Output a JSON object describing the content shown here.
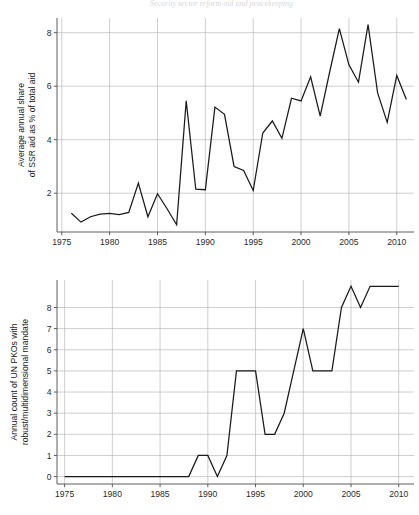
{
  "figure": {
    "header_fragment": "Security sector reform aid and peacekeeping",
    "background": "#ffffff",
    "line_color": "#1a1a1a",
    "grid_color": "#b9b9b9",
    "axis_color": "#4d4d4d"
  },
  "chart_data": [
    {
      "type": "line",
      "panel": "top",
      "title": "",
      "xlabel": "",
      "ylabel": "Average annual share\nof SSR aid as % of total aid",
      "ylabel_line1": "Average annual share",
      "ylabel_line2": "of SSR aid as % of total aid",
      "xlim": [
        1974.5,
        2011.8
      ],
      "ylim": [
        0.55,
        8.55
      ],
      "xticks": [
        1975,
        1980,
        1985,
        1990,
        1995,
        2000,
        2005,
        2010
      ],
      "xticklabels": [
        "1975",
        "1980",
        "1985",
        "1990",
        "1995",
        "2000",
        "2005",
        "2010"
      ],
      "yticks": [
        2,
        4,
        6,
        8
      ],
      "yticklabels": [
        "2",
        "4",
        "6",
        "8"
      ],
      "grid": true,
      "legend": false,
      "series": [
        {
          "name": "Average annual share of SSR aid as % of total aid",
          "x": [
            1976,
            1977,
            1978,
            1979,
            1980,
            1981,
            1982,
            1983,
            1984,
            1985,
            1986,
            1987,
            1988,
            1989,
            1990,
            1991,
            1992,
            1993,
            1994,
            1995,
            1996,
            1997,
            1998,
            1999,
            2000,
            2001,
            2002,
            2003,
            2004,
            2005,
            2006,
            2007,
            2008,
            2009,
            2010,
            2011
          ],
          "values": [
            1.25,
            0.92,
            1.12,
            1.22,
            1.25,
            1.2,
            1.28,
            2.38,
            1.12,
            1.98,
            1.42,
            0.82,
            5.45,
            2.15,
            2.13,
            5.22,
            4.95,
            3.0,
            2.85,
            2.1,
            4.25,
            4.7,
            4.05,
            5.55,
            5.45,
            6.35,
            4.88,
            6.55,
            8.15,
            6.8,
            6.15,
            8.3,
            5.75,
            4.65,
            6.4,
            5.5
          ]
        }
      ]
    },
    {
      "type": "line",
      "panel": "bottom",
      "title": "",
      "xlabel": "",
      "ylabel": "Annual count of UN PKOs with\nrobust/multidimensional mandate",
      "ylabel_line1": "Annual count of UN PKOs with",
      "ylabel_line2": "robust/multidimensional mandate",
      "xlim": [
        1974.2,
        2011.6
      ],
      "ylim": [
        -0.35,
        9.3
      ],
      "xticks": [
        1975,
        1980,
        1985,
        1990,
        1995,
        2000,
        2005,
        2010
      ],
      "xticklabels": [
        "1975",
        "1980",
        "1985",
        "1990",
        "1995",
        "2000",
        "2005",
        "2010"
      ],
      "yticks": [
        0,
        1,
        2,
        3,
        4,
        5,
        6,
        7,
        8
      ],
      "yticklabels": [
        "0",
        "1",
        "2",
        "3",
        "4",
        "5",
        "6",
        "7",
        "8"
      ],
      "grid": true,
      "legend": false,
      "series": [
        {
          "name": "Annual count of UN PKOs with robust/multidimensional mandate",
          "x": [
            1975,
            1976,
            1977,
            1978,
            1979,
            1980,
            1981,
            1982,
            1983,
            1984,
            1985,
            1986,
            1987,
            1988,
            1989,
            1990,
            1991,
            1992,
            1993,
            1994,
            1995,
            1996,
            1997,
            1998,
            1999,
            2000,
            2001,
            2002,
            2003,
            2004,
            2005,
            2006,
            2007,
            2008,
            2009,
            2010
          ],
          "values": [
            0,
            0,
            0,
            0,
            0,
            0,
            0,
            0,
            0,
            0,
            0,
            0,
            0,
            0,
            1,
            1,
            0,
            1,
            5,
            5,
            5,
            2,
            2,
            3,
            5,
            7,
            5,
            5,
            5,
            8,
            9,
            8,
            9,
            9,
            9,
            9
          ]
        }
      ]
    }
  ]
}
